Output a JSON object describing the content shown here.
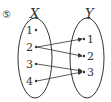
{
  "problem_number": "⑤",
  "domain_set": {
    "label": "X",
    "elements": [
      "1",
      "2",
      "3",
      "4"
    ]
  },
  "codomain_set": {
    "label": "Y",
    "elements": [
      "1",
      "2",
      "3"
    ]
  },
  "mappings": [
    {
      "from": "2",
      "to": "1"
    },
    {
      "from": "2",
      "to": "2"
    },
    {
      "from": "3",
      "to": "3"
    },
    {
      "from": "4",
      "to": "3"
    }
  ],
  "colors": {
    "stroke": "#333333",
    "background": "#ffffff"
  }
}
